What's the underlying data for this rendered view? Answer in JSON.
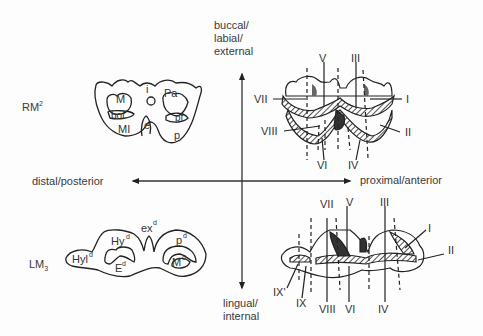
{
  "axes": {
    "top": [
      "buccal/",
      "labial/",
      "external"
    ],
    "bottom": [
      "lingual/",
      "internal"
    ],
    "left": "distal/posterior",
    "right": "proximal/anterior"
  },
  "upper_tooth": {
    "name": "RM",
    "sup": "2",
    "labels": {
      "M": "M",
      "i": "i",
      "Pa": "Pa",
      "bof": "bof",
      "pf": "pf",
      "MI": "MI",
      "e": "e",
      "p": "p"
    }
  },
  "lower_tooth": {
    "name": "LM",
    "sub": "3",
    "labels": {
      "ex": "ex",
      "ex_sup": "d",
      "Hy": "Hy",
      "Hy_sup": "d",
      "p": "p",
      "p_sup": "d",
      "Hyl": "Hyl",
      "Hyl_sup": "d",
      "E": "E",
      "E_sup": "d",
      "M": "M",
      "M_sup": "d"
    }
  },
  "upper_crests": {
    "V": "V",
    "III": "III",
    "VII": "VII",
    "I": "I",
    "VIII": "VIII",
    "II": "II",
    "VI": "VI",
    "IV": "IV"
  },
  "lower_crests": {
    "VII": "VII",
    "V": "V",
    "III": "III",
    "I": "I",
    "II": "II",
    "IX_prime": "IX'",
    "IX": "IX",
    "VIII": "VIII",
    "VI": "VI",
    "IV": "IV"
  }
}
